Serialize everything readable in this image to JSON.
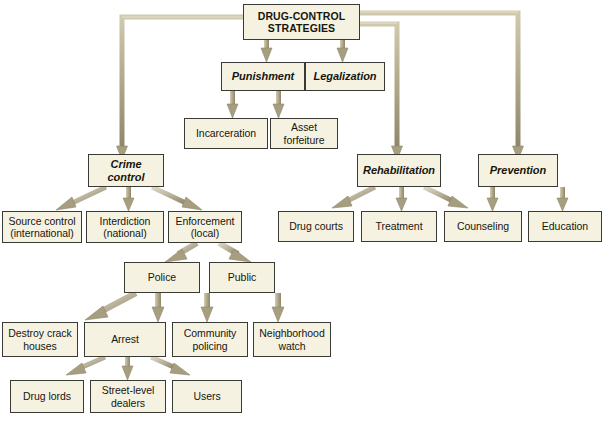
{
  "diagram": {
    "title_node": "DRUG-CONTROL\nSTRATEGIES",
    "background_color": "#ffffff",
    "node_fill": "#f6f2e2",
    "node_border": "#3a3a34",
    "connector_color": "#a39a78",
    "nodes": {
      "root": "DRUG-CONTROL\nSTRATEGIES",
      "punishment": "Punishment",
      "legalization": "Legalization",
      "incarceration": "Incarceration",
      "asset_forfeiture": "Asset\nforfeiture",
      "crime_control": "Crime\ncontrol",
      "rehabilitation": "Rehabilitation",
      "prevention": "Prevention",
      "source_control": "Source control\n(international)",
      "interdiction": "Interdiction\n(national)",
      "enforcement": "Enforcement\n(local)",
      "drug_courts": "Drug courts",
      "treatment": "Treatment",
      "counseling": "Counseling",
      "education": "Education",
      "police": "Police",
      "public": "Public",
      "destroy_crack_houses": "Destroy crack\nhouses",
      "arrest": "Arrest",
      "community_policing": "Community\npolicing",
      "neighborhood_watch": "Neighborhood\nwatch",
      "drug_lords": "Drug lords",
      "street_level_dealers": "Street-level\ndealers",
      "users": "Users"
    }
  }
}
